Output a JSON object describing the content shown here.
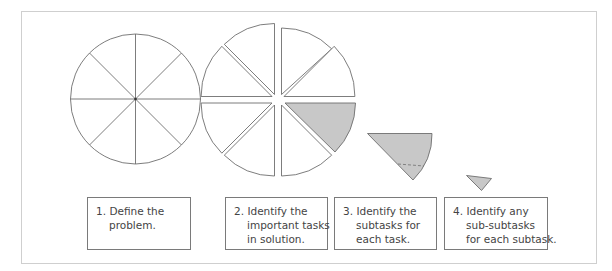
{
  "diagram": {
    "colors": {
      "stroke": "#6e6e6e",
      "wedge_fill": "#c8c8c8",
      "frame_border": "#cfcfcf",
      "text": "#444444"
    },
    "steps": [
      {
        "number": "1.",
        "lines": [
          "Define the",
          "problem."
        ]
      },
      {
        "number": "2.",
        "lines": [
          "Identify the",
          "important tasks",
          "in solution."
        ]
      },
      {
        "number": "3.",
        "lines": [
          "Identify the",
          "subtasks for",
          "each task."
        ]
      },
      {
        "number": "4.",
        "lines": [
          "Identify any",
          "sub-subtasks",
          "for each subtask."
        ]
      }
    ],
    "figures": [
      {
        "name": "whole-problem-circle",
        "slices": 8
      },
      {
        "name": "exploded-task-circle",
        "slices": 8,
        "highlighted_slice": 1
      },
      {
        "name": "subtask-wedge"
      },
      {
        "name": "sub-subtask-wedge"
      }
    ]
  }
}
